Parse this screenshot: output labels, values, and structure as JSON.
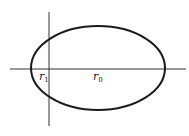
{
  "diagram": {
    "labels": {
      "r1": {
        "base": "r",
        "sub": "1"
      },
      "r0": {
        "base": "r",
        "sub": "0"
      }
    },
    "colors": {
      "stroke": "#1a1a1a",
      "axis": "#333333",
      "background": "#ffffff"
    }
  }
}
